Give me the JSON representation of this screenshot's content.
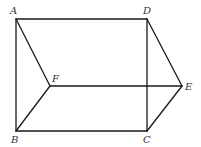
{
  "diagram": {
    "type": "geometric-figure",
    "colors": {
      "line": "#1a1a1a",
      "label": "#333333",
      "background": "#ffffff"
    },
    "vertices": {
      "A": {
        "label": "A",
        "x": 16,
        "y": 19,
        "lx": 10,
        "ly": 14
      },
      "D": {
        "label": "D",
        "x": 147,
        "y": 19,
        "lx": 143,
        "ly": 14
      },
      "E": {
        "label": "E",
        "x": 182,
        "y": 86,
        "lx": 185,
        "ly": 90
      },
      "C": {
        "label": "C",
        "x": 147,
        "y": 131,
        "lx": 143,
        "ly": 143
      },
      "B": {
        "label": "B",
        "x": 16,
        "y": 131,
        "lx": 11,
        "ly": 143
      },
      "F": {
        "label": "F",
        "x": 50,
        "y": 86,
        "lx": 52,
        "ly": 82
      }
    },
    "edges": [
      [
        "A",
        "D"
      ],
      [
        "A",
        "B"
      ],
      [
        "A",
        "F"
      ],
      [
        "D",
        "C"
      ],
      [
        "D",
        "E"
      ],
      [
        "F",
        "E"
      ],
      [
        "F",
        "B"
      ],
      [
        "B",
        "C"
      ],
      [
        "C",
        "E"
      ]
    ]
  }
}
